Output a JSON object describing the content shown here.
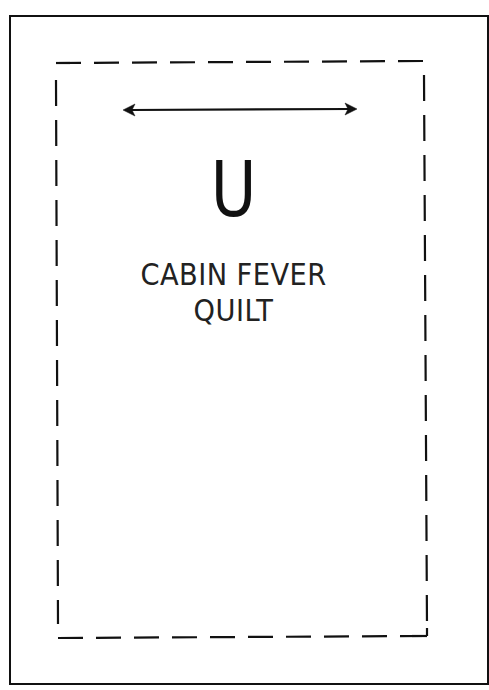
{
  "document": {
    "type": "quilt-label-template",
    "letter": "U",
    "title_lines": [
      "CABIN FEVER",
      "QUILT"
    ],
    "grain_arrow": "horizontal-double-arrow",
    "outer_border_style": "solid",
    "inner_border_style": "dashed",
    "colors": {
      "ink": "#111111",
      "paper": "#ffffff"
    }
  }
}
